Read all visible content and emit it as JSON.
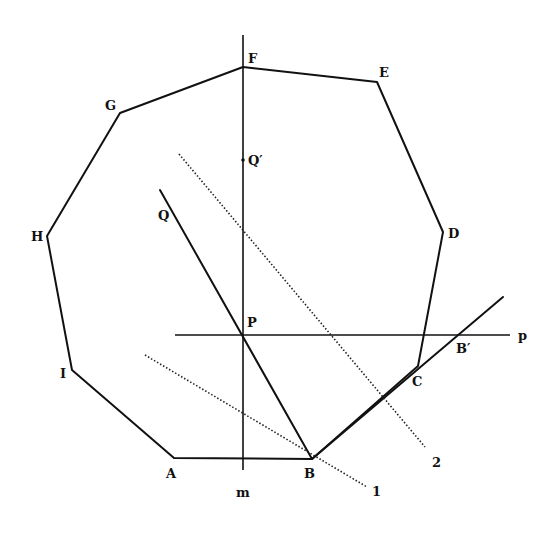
{
  "diagram": {
    "type": "geometry-construction",
    "polygon": {
      "name": "nonagon",
      "vertices": [
        {
          "label": "A",
          "x": 174,
          "y": 458,
          "lx": 166,
          "ly": 478
        },
        {
          "label": "B",
          "x": 312,
          "y": 459,
          "lx": 304,
          "ly": 478
        },
        {
          "label": "C",
          "x": 418,
          "y": 366,
          "lx": 412,
          "ly": 386
        },
        {
          "label": "D",
          "x": 443,
          "y": 232,
          "lx": 448,
          "ly": 238
        },
        {
          "label": "E",
          "x": 377,
          "y": 82,
          "lx": 379,
          "ly": 77
        },
        {
          "label": "F",
          "x": 243,
          "y": 67,
          "lx": 248,
          "ly": 63
        },
        {
          "label": "G",
          "x": 120,
          "y": 113,
          "lx": 105,
          "ly": 110
        },
        {
          "label": "H",
          "x": 47,
          "y": 236,
          "lx": 31,
          "ly": 241
        },
        {
          "label": "I",
          "x": 72,
          "y": 370,
          "lx": 60,
          "ly": 378
        }
      ]
    },
    "lines": {
      "m": {
        "label": "m",
        "x1": 243,
        "y1": 35,
        "x2": 243,
        "y2": 470,
        "lx": 236,
        "ly": 497
      },
      "p": {
        "label": "p",
        "x1": 175,
        "y1": 335,
        "x2": 510,
        "y2": 335,
        "lx": 518,
        "ly": 340
      },
      "QB": {
        "x1": 160,
        "y1": 190,
        "x2": 312,
        "y2": 459
      },
      "B_ray": {
        "x1": 312,
        "y1": 459,
        "x2": 503,
        "y2": 297
      },
      "dotted_1": {
        "label": "1",
        "x1": 145,
        "y1": 355,
        "x2": 367,
        "y2": 487,
        "lx": 372,
        "ly": 496
      },
      "dotted_2": {
        "label": "2",
        "x1": 179,
        "y1": 154,
        "x2": 425,
        "y2": 447,
        "lx": 432,
        "ly": 467
      }
    },
    "points": {
      "P": {
        "label": "P",
        "x": 243,
        "y": 335,
        "lx": 247,
        "ly": 327
      },
      "Q": {
        "label": "Q",
        "lx": 158,
        "ly": 220
      },
      "Q_prime": {
        "label": "Q′",
        "x": 243,
        "y": 160,
        "lx": 248,
        "ly": 165
      },
      "B_prime": {
        "label": "B′",
        "x": 461,
        "y": 335,
        "lx": 456,
        "ly": 353
      }
    }
  }
}
